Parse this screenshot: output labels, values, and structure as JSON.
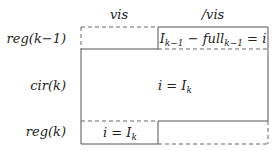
{
  "columns": {
    "left": "vis",
    "right": "/vis"
  },
  "rows": {
    "top": "reg(k−1)",
    "middle": "cir(k)",
    "bottom": "reg(k)"
  },
  "cells": {
    "top_right": {
      "base1": "I",
      "sub1": "k−1",
      "mid": " − full",
      "sub2": "k−1",
      "tail": " = i"
    },
    "middle": {
      "head": "i = I",
      "sub": "k"
    },
    "bottom_left": {
      "head": "i = I",
      "sub": "k"
    }
  }
}
